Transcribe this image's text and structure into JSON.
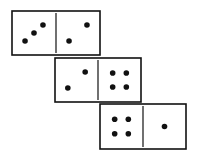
{
  "dominoes": [
    {
      "left_pips": 3,
      "right_pips": 2
    },
    {
      "left_pips": 2,
      "right_pips": 4
    },
    {
      "left_pips": 4,
      "right_pips": 1
    }
  ],
  "colors": {
    "ink": "#111111",
    "background": "#ffffff"
  }
}
